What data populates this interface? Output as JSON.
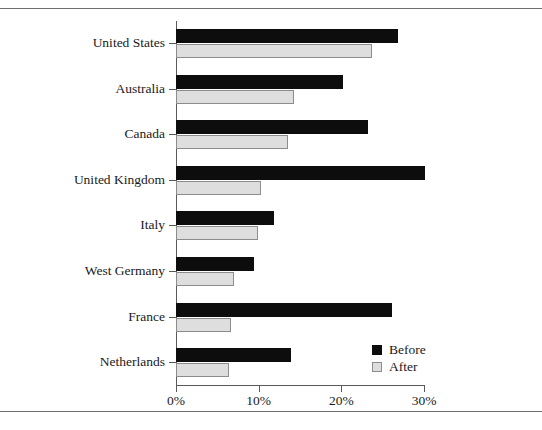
{
  "chart_data": {
    "type": "bar",
    "orientation": "horizontal",
    "title": "",
    "xlabel": "",
    "ylabel": "",
    "xlim": [
      0,
      30
    ],
    "xticks": [
      "0%",
      "10%",
      "20%",
      "30%"
    ],
    "xtick_values": [
      0,
      10,
      20,
      30
    ],
    "grid": false,
    "legend_position": "bottom-right",
    "categories": [
      "United States",
      "Australia",
      "Canada",
      "United Kingdom",
      "Italy",
      "West Germany",
      "France",
      "Netherlands"
    ],
    "series": [
      {
        "name": "Before",
        "color": "#0d0d0d",
        "values": [
          26.8,
          20.2,
          23.2,
          30.1,
          11.8,
          9.4,
          26.1,
          13.9
        ]
      },
      {
        "name": "After",
        "color": "#dedede",
        "values": [
          23.7,
          14.3,
          13.5,
          10.3,
          9.9,
          7.0,
          6.6,
          6.4
        ]
      }
    ]
  },
  "legend": {
    "items": [
      {
        "label": "Before",
        "swatch": "before"
      },
      {
        "label": "After",
        "swatch": "after"
      }
    ]
  },
  "caption": ""
}
